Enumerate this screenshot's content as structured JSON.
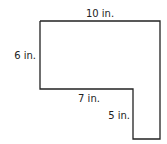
{
  "diagram": {
    "type": "L-shaped polygon with dimension labels",
    "stroke_color": "#222222",
    "background": "#ffffff",
    "labels": {
      "top": "10 in.",
      "left": "6 in.",
      "inner_horizontal": "7 in.",
      "inner_vertical": "5 in."
    },
    "vertices": [
      [
        40,
        21
      ],
      [
        160,
        21
      ],
      [
        160,
        139
      ],
      [
        133,
        139
      ],
      [
        133,
        89
      ],
      [
        40,
        89
      ]
    ]
  }
}
